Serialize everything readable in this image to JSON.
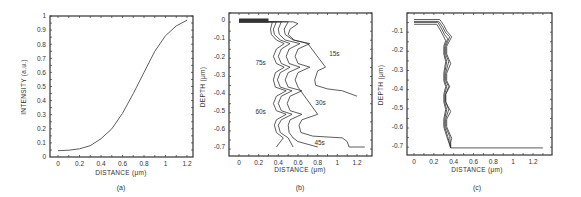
{
  "figure": {
    "ink_color": "#333333",
    "background": "#ffffff"
  },
  "chart_data": [
    {
      "panel": "(a)",
      "type": "line",
      "title": "",
      "xlabel": "DISTANCE (μm)",
      "ylabel": "INTENSITY (a.u.)",
      "xlim": [
        0,
        1.25
      ],
      "ylim": [
        0,
        1
      ],
      "x_ticks": [
        "0",
        "0.2",
        "0.4",
        "0.6",
        "0.8",
        "1",
        "1.2"
      ],
      "y_ticks": [
        "0",
        "0.1",
        "0.2",
        "0.3",
        "0.4",
        "0.5",
        "0.6",
        "0.7",
        "0.8",
        "0.9",
        "1"
      ],
      "grid": false,
      "series": [
        {
          "name": "intensity",
          "x": [
            0,
            0.1,
            0.2,
            0.3,
            0.4,
            0.5,
            0.6,
            0.7,
            0.8,
            0.9,
            1.0,
            1.1,
            1.2
          ],
          "y": [
            0.045,
            0.048,
            0.058,
            0.08,
            0.13,
            0.2,
            0.31,
            0.45,
            0.6,
            0.75,
            0.86,
            0.93,
            0.97
          ]
        }
      ]
    },
    {
      "panel": "(b)",
      "type": "line",
      "title": "",
      "xlabel": "DISTANCE (μm)",
      "ylabel": "DEPTH (μm)",
      "xlim": [
        -0.05,
        1.3
      ],
      "ylim": [
        -0.74,
        0.03
      ],
      "x_ticks": [
        "0",
        "0.2",
        "0.4",
        "0.6",
        "0.8",
        "1",
        "1.2"
      ],
      "y_ticks": [
        "0",
        "-0.1",
        "-0.2",
        "-0.3",
        "-0.4",
        "-0.5",
        "-0.6",
        "-0.7"
      ],
      "grid": false,
      "annotations": [
        {
          "text": "15s",
          "x": 0.97,
          "y": -0.2
        },
        {
          "text": "30s",
          "x": 0.83,
          "y": -0.47
        },
        {
          "text": "45s",
          "x": 0.82,
          "y": -0.69
        },
        {
          "text": "60s",
          "x": 0.22,
          "y": -0.52
        },
        {
          "text": "75s",
          "x": 0.22,
          "y": -0.25
        }
      ],
      "series": [
        {
          "name": "15s",
          "x": [
            0,
            0.55,
            0.6,
            0.52,
            0.5,
            0.56,
            0.7,
            0.88,
            0.8,
            0.77,
            0.78,
            0.9,
            1.05,
            1.2
          ],
          "y": [
            -0.01,
            -0.01,
            -0.02,
            -0.05,
            -0.08,
            -0.11,
            -0.13,
            -0.26,
            -0.28,
            -0.33,
            -0.36,
            -0.38,
            -0.39,
            -0.42
          ]
        },
        {
          "name": "30s",
          "x": [
            0,
            0.5,
            0.46,
            0.47,
            0.55,
            0.72,
            0.6,
            0.57,
            0.6,
            0.72,
            0.6,
            0.57,
            0.6,
            0.8,
            0.64,
            0.61,
            0.63,
            0.75,
            1.05,
            1.1,
            1.12,
            1.28
          ],
          "y": [
            -0.01,
            -0.01,
            -0.05,
            -0.08,
            -0.11,
            -0.13,
            -0.16,
            -0.2,
            -0.24,
            -0.26,
            -0.29,
            -0.33,
            -0.37,
            -0.52,
            -0.55,
            -0.58,
            -0.62,
            -0.64,
            -0.65,
            -0.67,
            -0.7,
            -0.7
          ]
        },
        {
          "name": "45s",
          "x": [
            0,
            0.43,
            0.4,
            0.41,
            0.47,
            0.62,
            0.51,
            0.48,
            0.51,
            0.62,
            0.5,
            0.47,
            0.5,
            0.64,
            0.52,
            0.49,
            0.52,
            0.64,
            0.52,
            0.5,
            0.51,
            0.55,
            0.6,
            0.8
          ],
          "y": [
            -0.01,
            -0.01,
            -0.05,
            -0.08,
            -0.11,
            -0.13,
            -0.16,
            -0.2,
            -0.24,
            -0.26,
            -0.29,
            -0.33,
            -0.37,
            -0.39,
            -0.42,
            -0.46,
            -0.5,
            -0.52,
            -0.55,
            -0.58,
            -0.62,
            -0.65,
            -0.67,
            -0.7
          ]
        },
        {
          "name": "60s",
          "x": [
            0,
            0.38,
            0.35,
            0.36,
            0.42,
            0.52,
            0.43,
            0.4,
            0.43,
            0.52,
            0.42,
            0.39,
            0.42,
            0.54,
            0.43,
            0.4,
            0.43,
            0.54,
            0.43,
            0.4,
            0.42,
            0.5,
            0.55
          ],
          "y": [
            -0.01,
            -0.01,
            -0.05,
            -0.08,
            -0.11,
            -0.13,
            -0.16,
            -0.2,
            -0.24,
            -0.26,
            -0.29,
            -0.33,
            -0.37,
            -0.39,
            -0.42,
            -0.46,
            -0.5,
            -0.52,
            -0.55,
            -0.58,
            -0.62,
            -0.65,
            -0.7
          ]
        },
        {
          "name": "75s",
          "x": [
            0,
            0.34,
            0.32,
            0.33,
            0.38,
            0.46,
            0.38,
            0.35,
            0.38,
            0.46,
            0.37,
            0.35,
            0.37,
            0.48,
            0.38,
            0.35,
            0.38,
            0.48,
            0.38,
            0.36,
            0.38,
            0.45,
            0.38
          ],
          "y": [
            -0.01,
            -0.01,
            -0.05,
            -0.08,
            -0.11,
            -0.13,
            -0.16,
            -0.2,
            -0.24,
            -0.26,
            -0.29,
            -0.33,
            -0.37,
            -0.39,
            -0.42,
            -0.46,
            -0.5,
            -0.52,
            -0.55,
            -0.58,
            -0.62,
            -0.65,
            -0.7
          ]
        }
      ]
    },
    {
      "panel": "(c)",
      "type": "line",
      "title": "",
      "xlabel": "DISTANCE (μm)",
      "ylabel": "DEPTH (μm)",
      "xlim": [
        -0.05,
        1.35
      ],
      "ylim": [
        -0.75,
        0.0
      ],
      "x_ticks": [
        "0",
        "0.2",
        "0.4",
        "0.6",
        "0.8",
        "1",
        "1.2"
      ],
      "y_ticks": [
        "-0.1",
        "-0.2",
        "-0.3",
        "-0.4",
        "-0.5",
        "-0.6",
        "-0.7"
      ],
      "grid": false,
      "series": [
        {
          "name": "profile-1",
          "x": [
            0,
            0.26,
            0.3,
            0.33,
            0.38,
            0.33,
            0.33,
            0.37,
            0.33,
            0.33,
            0.36,
            0.32,
            0.32,
            0.37,
            0.33,
            0.33,
            0.38,
            0.37,
            0.37,
            1.3
          ],
          "y": [
            -0.04,
            -0.04,
            -0.07,
            -0.1,
            -0.13,
            -0.18,
            -0.22,
            -0.27,
            -0.32,
            -0.36,
            -0.39,
            -0.43,
            -0.47,
            -0.52,
            -0.56,
            -0.6,
            -0.66,
            -0.68,
            -0.71,
            -0.71
          ]
        },
        {
          "name": "profile-2",
          "x": [
            0,
            0.25,
            0.29,
            0.32,
            0.36,
            0.32,
            0.32,
            0.35,
            0.32,
            0.32,
            0.35,
            0.32,
            0.32,
            0.35,
            0.32,
            0.32,
            0.36,
            0.37
          ],
          "y": [
            -0.05,
            -0.05,
            -0.08,
            -0.11,
            -0.13,
            -0.18,
            -0.22,
            -0.26,
            -0.32,
            -0.36,
            -0.39,
            -0.43,
            -0.47,
            -0.51,
            -0.56,
            -0.6,
            -0.65,
            -0.71
          ]
        },
        {
          "name": "profile-3",
          "x": [
            0,
            0.24,
            0.28,
            0.31,
            0.34,
            0.31,
            0.31,
            0.33,
            0.31,
            0.31,
            0.33,
            0.31,
            0.31,
            0.33,
            0.31,
            0.31,
            0.34,
            0.37
          ],
          "y": [
            -0.055,
            -0.055,
            -0.09,
            -0.12,
            -0.14,
            -0.18,
            -0.22,
            -0.26,
            -0.32,
            -0.36,
            -0.39,
            -0.43,
            -0.47,
            -0.51,
            -0.56,
            -0.6,
            -0.65,
            -0.71
          ]
        },
        {
          "name": "profile-4",
          "x": [
            0,
            0.23,
            0.27,
            0.3,
            0.32,
            0.3,
            0.3,
            0.32,
            0.3,
            0.3,
            0.32,
            0.3,
            0.3,
            0.32,
            0.3,
            0.3,
            0.33,
            0.37
          ],
          "y": [
            -0.065,
            -0.065,
            -0.1,
            -0.13,
            -0.15,
            -0.18,
            -0.22,
            -0.26,
            -0.32,
            -0.36,
            -0.39,
            -0.43,
            -0.47,
            -0.51,
            -0.56,
            -0.6,
            -0.65,
            -0.71
          ]
        }
      ]
    }
  ],
  "panels": [
    {
      "label": "(a)",
      "box": {
        "x0": 50,
        "y0": 16,
        "x1": 193,
        "y1": 157
      },
      "x_axis_px": [
        58,
        187
      ],
      "x_axis_val": [
        0,
        1.2
      ],
      "y_axis_px": [
        157,
        16
      ],
      "y_axis_val": [
        0,
        1
      ],
      "label_pos": [
        121,
        190
      ],
      "xlabel_pos": [
        121,
        175
      ],
      "ylabel_pos": [
        26,
        87
      ]
    },
    {
      "label": "(b)",
      "box": {
        "x0": 229,
        "y0": 13,
        "x1": 372,
        "y1": 156
      },
      "x_axis_px": [
        239,
        357
      ],
      "x_axis_val": [
        0,
        1.2
      ],
      "y_axis_px": [
        20,
        147
      ],
      "y_axis_val": [
        0,
        -0.7
      ],
      "label_pos": [
        300,
        190
      ],
      "xlabel_pos": [
        300,
        172
      ],
      "ylabel_pos": [
        205,
        87
      ]
    },
    {
      "label": "(c)",
      "box": {
        "x0": 407,
        "y0": 13,
        "x1": 552,
        "y1": 155
      },
      "x_axis_px": [
        414,
        533
      ],
      "x_axis_val": [
        0,
        1.2
      ],
      "y_axis_px": [
        31,
        146
      ],
      "y_axis_val": [
        -0.1,
        -0.7
      ],
      "label_pos": [
        477,
        190
      ],
      "xlabel_pos": [
        477,
        172
      ],
      "ylabel_pos": [
        383,
        85
      ]
    }
  ]
}
